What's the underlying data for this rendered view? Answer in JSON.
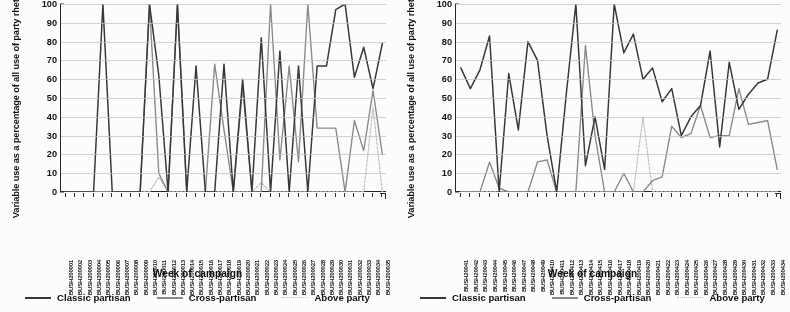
{
  "figure": {
    "panel_count": 2,
    "y_axis_label": "Variable use as a percentage of all use of party rhetoric",
    "x_axis_label": "Week of campaign",
    "legend": [
      {
        "key": "classic",
        "label": "Classic partisan",
        "color": "#3b3b3b",
        "style": "solid"
      },
      {
        "key": "cross",
        "label": "Cross-partisan",
        "color": "#8a8a8a",
        "style": "solid"
      },
      {
        "key": "above",
        "label": "Above party",
        "color": "#c2c2c2",
        "style": "dotted"
      }
    ],
    "y_ticks": [
      0,
      10,
      20,
      30,
      40,
      50,
      60,
      70,
      80,
      90,
      100
    ]
  },
  "chart_data": [
    {
      "type": "line",
      "title": "",
      "xlabel": "Week of campaign",
      "ylabel": "Variable use as a percentage of all use of party rhetoric",
      "ylim": [
        0,
        100
      ],
      "grid": true,
      "legend_position": "bottom",
      "categories": [
        "BUSH200001",
        "BUSH200002",
        "BUSH200003",
        "BUSH200004",
        "BUSH200005",
        "BUSH200006",
        "BUSH200007",
        "BUSH200008",
        "BUSH200009",
        "BUSH200010",
        "BUSH200011",
        "BUSH200012",
        "BUSH200013",
        "BUSH200014",
        "BUSH200015",
        "BUSH200016",
        "BUSH200017",
        "BUSH200018",
        "BUSH200019",
        "BUSH200020",
        "BUSH200021",
        "BUSH200022",
        "BUSH200023",
        "BUSH200024",
        "BUSH200025",
        "BUSH200026",
        "BUSH200027",
        "BUSH200028",
        "BUSH200029",
        "BUSH200030",
        "BUSH200031",
        "BUSH200032",
        "BUSH200033",
        "BUSH200034",
        "BUSH200035"
      ],
      "series": [
        {
          "name": "Classic partisan",
          "color": "#3b3b3b",
          "values": [
            0,
            0,
            0,
            0,
            100,
            0,
            0,
            0,
            0,
            100,
            62,
            0,
            100,
            0,
            67,
            0,
            0,
            68,
            0,
            60,
            0,
            82,
            0,
            75,
            0,
            67,
            0,
            67,
            67,
            97,
            100,
            61,
            77,
            55,
            79
          ]
        },
        {
          "name": "Cross-partisan",
          "color": "#8a8a8a",
          "values": [
            0,
            0,
            0,
            0,
            0,
            0,
            0,
            0,
            0,
            100,
            10,
            0,
            100,
            0,
            0,
            0,
            68,
            33,
            0,
            56,
            0,
            0,
            100,
            17,
            67,
            16,
            100,
            34,
            34,
            34,
            0,
            38,
            22,
            54,
            20
          ]
        },
        {
          "name": "Above party",
          "color": "#c2c2c2",
          "values": [
            0,
            0,
            0,
            0,
            0,
            0,
            0,
            0,
            0,
            0,
            8,
            0,
            0,
            0,
            0,
            0,
            0,
            0,
            0,
            0,
            0,
            5,
            0,
            0,
            0,
            0,
            0,
            0,
            0,
            0,
            0,
            0,
            0,
            45,
            0
          ]
        }
      ]
    },
    {
      "type": "line",
      "title": "",
      "xlabel": "Week of campaign",
      "ylabel": "Variable use as a percentage of all use of party rhetoric",
      "ylim": [
        0,
        100
      ],
      "grid": true,
      "legend_position": "bottom",
      "categories": [
        "BUSH20041",
        "BUSH20042",
        "BUSH20043",
        "BUSH20044",
        "BUSH20045",
        "BUSH20046",
        "BUSH20047",
        "BUSH20048",
        "BUSH20049",
        "BUSH200410",
        "BUSH200411",
        "BUSH200412",
        "BUSH200413",
        "BUSH200414",
        "BUSH200415",
        "BUSH200416",
        "BUSH200417",
        "BUSH200418",
        "BUSH200419",
        "BUSH200420",
        "BUSH200421",
        "BUSH200422",
        "BUSH200423",
        "BUSH200424",
        "BUSH200425",
        "BUSH200426",
        "BUSH200427",
        "BUSH200428",
        "BUSH200429",
        "BUSH200430",
        "BUSH200431",
        "BUSH200432",
        "BUSH200433",
        "BUSH200434"
      ],
      "series": [
        {
          "name": "Classic partisan",
          "color": "#3b3b3b",
          "values": [
            66,
            55,
            65,
            83,
            0,
            63,
            33,
            80,
            70,
            30,
            0,
            52,
            100,
            14,
            40,
            12,
            100,
            74,
            84,
            60,
            66,
            48,
            55,
            30,
            40,
            46,
            75,
            24,
            69,
            44,
            52,
            58,
            60,
            86
          ]
        },
        {
          "name": "Cross-partisan",
          "color": "#8a8a8a",
          "values": [
            0,
            0,
            0,
            16,
            2,
            0,
            0,
            0,
            16,
            17,
            0,
            0,
            0,
            78,
            30,
            0,
            0,
            10,
            0,
            0,
            6,
            8,
            35,
            29,
            31,
            46,
            29,
            30,
            30,
            55,
            36,
            37,
            38,
            12
          ]
        },
        {
          "name": "Above party",
          "color": "#c2c2c2",
          "values": [
            0,
            0,
            0,
            0,
            0,
            0,
            0,
            0,
            0,
            0,
            0,
            0,
            0,
            0,
            0,
            0,
            0,
            0,
            0,
            40,
            0,
            0,
            0,
            0,
            0,
            0,
            0,
            0,
            0,
            0,
            0,
            0,
            0,
            0
          ]
        }
      ]
    }
  ]
}
